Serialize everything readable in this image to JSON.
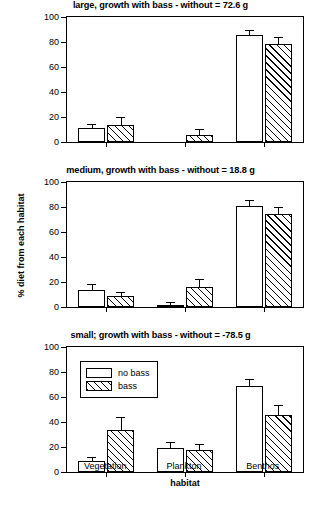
{
  "figure": {
    "yaxis_label": "% diet from each habitat",
    "xaxis_label": "habitat",
    "categories": [
      "Vegetation",
      "Plankton",
      "Benthos"
    ],
    "yticks": [
      "0",
      "20",
      "40",
      "60",
      "80",
      "100"
    ],
    "legend": {
      "items": [
        {
          "label": "no bass",
          "pattern": "open"
        },
        {
          "label": "bass",
          "pattern": "hatched"
        }
      ]
    }
  },
  "chart_data": [
    {
      "type": "bar",
      "title": "large, growth with bass - without = 72.6 g",
      "xlabel": "habitat",
      "ylabel": "% diet from each habitat",
      "ylim": [
        0,
        100
      ],
      "yticks": [
        0,
        20,
        40,
        60,
        80,
        100
      ],
      "grid": false,
      "legend_position": "none",
      "categories": [
        "Vegetation",
        "Plankton",
        "Benthos"
      ],
      "series": [
        {
          "name": "no bass",
          "values": [
            11,
            0,
            86
          ],
          "errors": [
            3,
            0,
            2.5
          ]
        },
        {
          "name": "bass",
          "values": [
            14,
            6,
            78.5
          ],
          "errors": [
            5,
            3.5,
            5
          ]
        }
      ]
    },
    {
      "type": "bar",
      "title": "medium, growth with bass - without = 18.8 g",
      "xlabel": "habitat",
      "ylabel": "% diet from each habitat",
      "ylim": [
        0,
        100
      ],
      "yticks": [
        0,
        20,
        40,
        60,
        80,
        100
      ],
      "grid": false,
      "legend_position": "none",
      "categories": [
        "Vegetation",
        "Plankton",
        "Benthos"
      ],
      "series": [
        {
          "name": "no bass",
          "values": [
            14,
            2,
            81
          ],
          "errors": [
            4,
            1,
            4
          ]
        },
        {
          "name": "bass",
          "values": [
            9,
            16,
            74.5
          ],
          "errors": [
            2.5,
            6,
            4.5
          ]
        }
      ]
    },
    {
      "type": "bar",
      "title": "small; growth with bass - without = -78.5 g",
      "xlabel": "habitat",
      "ylabel": "% diet from each habitat",
      "ylim": [
        0,
        100
      ],
      "yticks": [
        0,
        20,
        40,
        60,
        80,
        100
      ],
      "grid": false,
      "legend_position": "upper-left",
      "categories": [
        "Vegetation",
        "Plankton",
        "Benthos"
      ],
      "series": [
        {
          "name": "no bass",
          "values": [
            9,
            19,
            69
          ],
          "errors": [
            2,
            4,
            5
          ]
        },
        {
          "name": "bass",
          "values": [
            34,
            17.5,
            46
          ],
          "errors": [
            9,
            4.5,
            7
          ]
        }
      ]
    }
  ]
}
